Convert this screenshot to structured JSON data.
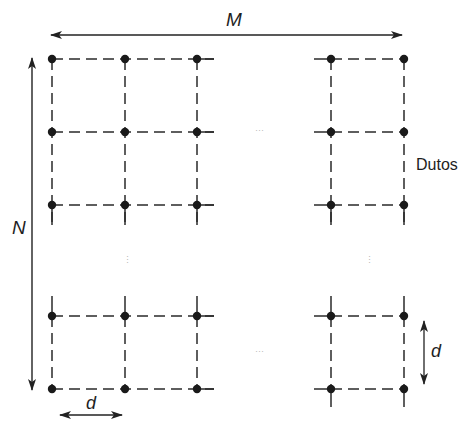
{
  "figure": {
    "labels": {
      "columns_symbol": "M",
      "rows_symbol": "N",
      "spacing_horizontal": "d",
      "spacing_vertical": "d",
      "ducts": "Dutos"
    },
    "ellipses": {
      "top_middle": "···",
      "bottom_middle": "···",
      "left_middle": "⋮",
      "right_middle": "⋮"
    },
    "grid": {
      "column_x": [
        52,
        125,
        197,
        331,
        404
      ],
      "row_y": [
        59,
        132,
        205,
        316,
        389
      ],
      "left_block_columns": 3,
      "right_block_columns": 2,
      "top_block_rows": 3,
      "bottom_block_rows": 2
    },
    "colors": {
      "line": "#2a2a2a",
      "dot": "#1a1a1a",
      "ellipsis": "#b8b8b8",
      "background": "#ffffff"
    }
  }
}
